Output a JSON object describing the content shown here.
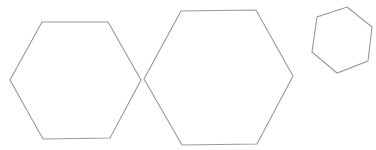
{
  "diagram": {
    "background": "#ffffff",
    "stroke_color": "#9a9a9a",
    "stroke_width": 1.1,
    "shapes": [
      {
        "name": "hexagon-left",
        "type": "hexagon",
        "points": "42,22 108,22 141,80 110,138 43,139 10,80"
      },
      {
        "name": "hexagon-middle",
        "type": "hexagon",
        "points": "181,11 256,10 293,76 257,144 182,145 144,79"
      },
      {
        "name": "hexagon-right-small-rotated",
        "type": "hexagon",
        "points": "347,7 372,27 368,61 337,73 312,52 317,17"
      }
    ]
  }
}
